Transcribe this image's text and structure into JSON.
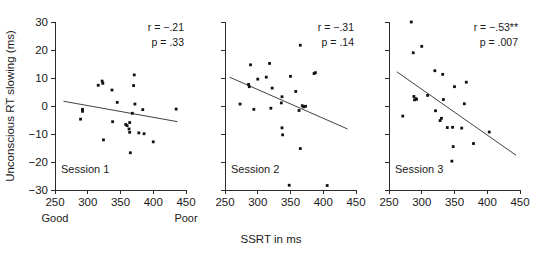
{
  "figure": {
    "xlabel": "SSRT in ms",
    "ylabel": "Unconscious RT slowing (ms)",
    "x_anchor_low": "Good",
    "x_anchor_high": "Poor"
  },
  "chart_data": [
    {
      "type": "scatter",
      "title": "Session 1",
      "xlabel": "SSRT in ms",
      "ylabel": "Unconscious RT slowing (ms)",
      "xlim": [
        250,
        450
      ],
      "ylim": [
        -30,
        30
      ],
      "xticks": [
        250,
        300,
        350,
        400,
        450
      ],
      "yticks": [
        -30,
        -20,
        -10,
        0,
        10,
        20,
        30
      ],
      "xtick_labels": [
        "250",
        "300",
        "350",
        "400",
        "450"
      ],
      "ytick_labels": [
        "-30",
        "-20",
        "-10",
        "0",
        "10",
        "20",
        "30"
      ],
      "grid": false,
      "legend": "none",
      "annotations": {
        "r": "r = −.21",
        "p": "p = .33"
      },
      "r_value": -0.21,
      "p_value": 0.33,
      "trend_line": {
        "x0": 263,
        "y0": 1.7,
        "x1": 437,
        "y1": -5.6
      },
      "points": [
        {
          "x": 289,
          "y": -4.7
        },
        {
          "x": 292,
          "y": -1.2
        },
        {
          "x": 292,
          "y": -1.9
        },
        {
          "x": 316,
          "y": 7.4
        },
        {
          "x": 322,
          "y": 8.9
        },
        {
          "x": 323,
          "y": 8.1
        },
        {
          "x": 324,
          "y": -12.1
        },
        {
          "x": 337,
          "y": 5.7
        },
        {
          "x": 338,
          "y": -5.6
        },
        {
          "x": 345,
          "y": 1.3
        },
        {
          "x": 358,
          "y": -6.6
        },
        {
          "x": 360,
          "y": -7.0
        },
        {
          "x": 363,
          "y": -8.2
        },
        {
          "x": 364,
          "y": -5.9
        },
        {
          "x": 364,
          "y": -9.4
        },
        {
          "x": 365,
          "y": -16.7
        },
        {
          "x": 368,
          "y": -2.6
        },
        {
          "x": 370,
          "y": 7.3
        },
        {
          "x": 371,
          "y": 11.1
        },
        {
          "x": 372,
          "y": 0.7
        },
        {
          "x": 378,
          "y": -9.6
        },
        {
          "x": 384,
          "y": -1.3
        },
        {
          "x": 386,
          "y": -9.9
        },
        {
          "x": 400,
          "y": -12.8
        },
        {
          "x": 435,
          "y": -1.1
        }
      ]
    },
    {
      "type": "scatter",
      "title": "Session 2",
      "xlabel": "SSRT in ms",
      "ylabel": "Unconscious RT slowing (ms)",
      "xlim": [
        250,
        450
      ],
      "ylim": [
        -30,
        30
      ],
      "xticks": [
        250,
        300,
        350,
        400,
        450
      ],
      "yticks": [
        -30,
        -20,
        -10,
        0,
        10,
        20,
        30
      ],
      "xtick_labels": [
        "250",
        "300",
        "350",
        "400",
        "450"
      ],
      "ytick_labels": [
        "-30",
        "-20",
        "-10",
        "0",
        "10",
        "20",
        "30"
      ],
      "grid": false,
      "legend": "none",
      "annotations": {
        "r": "r = −.31",
        "p": "p = .14"
      },
      "r_value": -0.31,
      "p_value": 0.14,
      "trend_line": {
        "x0": 257,
        "y0": 10.3,
        "x1": 437,
        "y1": -8.2
      },
      "points": [
        {
          "x": 273,
          "y": 0.7
        },
        {
          "x": 286,
          "y": 7.7
        },
        {
          "x": 287,
          "y": 6.9
        },
        {
          "x": 289,
          "y": 14.7
        },
        {
          "x": 294,
          "y": -1.2
        },
        {
          "x": 300,
          "y": 9.6
        },
        {
          "x": 313,
          "y": 10.3
        },
        {
          "x": 318,
          "y": 15.2
        },
        {
          "x": 320,
          "y": -0.8
        },
        {
          "x": 322,
          "y": 6.4
        },
        {
          "x": 336,
          "y": 1.1
        },
        {
          "x": 337,
          "y": 3.3
        },
        {
          "x": 337,
          "y": -7.8
        },
        {
          "x": 338,
          "y": -10.3
        },
        {
          "x": 348,
          "y": -28.3
        },
        {
          "x": 350,
          "y": 10.6
        },
        {
          "x": 358,
          "y": 5.2
        },
        {
          "x": 363,
          "y": -1.6
        },
        {
          "x": 365,
          "y": 21.7
        },
        {
          "x": 365,
          "y": -15.2
        },
        {
          "x": 368,
          "y": 0.1
        },
        {
          "x": 370,
          "y": -0.3
        },
        {
          "x": 373,
          "y": -0.1
        },
        {
          "x": 386,
          "y": 11.6
        },
        {
          "x": 388,
          "y": 11.9
        },
        {
          "x": 406,
          "y": -28.4
        }
      ]
    },
    {
      "type": "scatter",
      "title": "Session 3",
      "xlabel": "SSRT in ms",
      "ylabel": "Unconscious RT slowing (ms)",
      "xlim": [
        250,
        450
      ],
      "ylim": [
        -30,
        30
      ],
      "xticks": [
        250,
        300,
        350,
        400,
        450
      ],
      "yticks": [
        -30,
        -20,
        -10,
        0,
        10,
        20,
        30
      ],
      "xtick_labels": [
        "250",
        "300",
        "350",
        "400",
        "450"
      ],
      "ytick_labels": [
        "-30",
        "-20",
        "-10",
        "0",
        "10",
        "20",
        "30"
      ],
      "grid": false,
      "legend": "none",
      "annotations": {
        "r": "r = −.53**",
        "p": "p = .007"
      },
      "r_value": -0.53,
      "p_value": 0.007,
      "trend_line": {
        "x0": 262,
        "y0": 12.2,
        "x1": 444,
        "y1": -17.6
      },
      "points": [
        {
          "x": 271,
          "y": -3.6
        },
        {
          "x": 284,
          "y": 30.0
        },
        {
          "x": 287,
          "y": 19.0
        },
        {
          "x": 288,
          "y": 3.4
        },
        {
          "x": 289,
          "y": 2.2
        },
        {
          "x": 291,
          "y": 2.6
        },
        {
          "x": 292,
          "y": 2.4
        },
        {
          "x": 300,
          "y": 21.3
        },
        {
          "x": 309,
          "y": 3.8
        },
        {
          "x": 320,
          "y": 12.6
        },
        {
          "x": 321,
          "y": -1.7
        },
        {
          "x": 328,
          "y": -5.2
        },
        {
          "x": 330,
          "y": -4.4
        },
        {
          "x": 332,
          "y": 11.3
        },
        {
          "x": 333,
          "y": 2.3
        },
        {
          "x": 339,
          "y": -7.7
        },
        {
          "x": 346,
          "y": -19.7
        },
        {
          "x": 347,
          "y": -7.6
        },
        {
          "x": 348,
          "y": -14.5
        },
        {
          "x": 350,
          "y": 6.9
        },
        {
          "x": 361,
          "y": -7.9
        },
        {
          "x": 365,
          "y": 0.8
        },
        {
          "x": 368,
          "y": 8.5
        },
        {
          "x": 379,
          "y": -13.4
        },
        {
          "x": 403,
          "y": -9.3
        }
      ]
    }
  ]
}
